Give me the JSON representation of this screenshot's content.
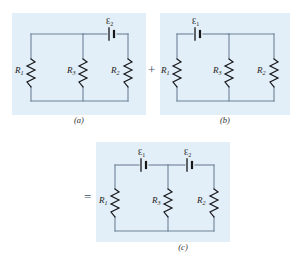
{
  "figure": {
    "background_color": "#ffffff",
    "panel_color": "#e2eef8",
    "wire_color": "#6d8296",
    "operators": {
      "plus": "+",
      "equals": "="
    },
    "panels": [
      {
        "id": "a",
        "caption": "(a)",
        "resistors": [
          {
            "name": "R1",
            "label": "R",
            "sub": "1",
            "branch": "left"
          },
          {
            "name": "R3",
            "label": "R",
            "sub": "3",
            "branch": "middle"
          },
          {
            "name": "R2",
            "label": "R",
            "sub": "2",
            "branch": "right"
          }
        ],
        "sources": [
          {
            "name": "emf2",
            "label": "Ɛ",
            "sub": "2",
            "position": "top-right"
          }
        ]
      },
      {
        "id": "b",
        "caption": "(b)",
        "resistors": [
          {
            "name": "R1",
            "label": "R",
            "sub": "1",
            "branch": "left"
          },
          {
            "name": "R3",
            "label": "R",
            "sub": "3",
            "branch": "middle"
          },
          {
            "name": "R2",
            "label": "R",
            "sub": "2",
            "branch": "right"
          }
        ],
        "sources": [
          {
            "name": "emf1",
            "label": "Ɛ",
            "sub": "1",
            "position": "top-left"
          }
        ]
      },
      {
        "id": "c",
        "caption": "(c)",
        "resistors": [
          {
            "name": "R1",
            "label": "R",
            "sub": "1",
            "branch": "left"
          },
          {
            "name": "R3",
            "label": "R",
            "sub": "3",
            "branch": "middle"
          },
          {
            "name": "R2",
            "label": "R",
            "sub": "2",
            "branch": "right"
          }
        ],
        "sources": [
          {
            "name": "emf1",
            "label": "Ɛ",
            "sub": "1",
            "position": "top-left"
          },
          {
            "name": "emf2",
            "label": "Ɛ",
            "sub": "2",
            "position": "top-right"
          }
        ]
      }
    ]
  }
}
